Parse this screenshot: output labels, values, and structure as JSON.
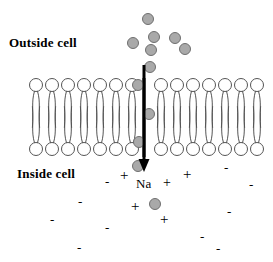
{
  "diagram": {
    "labels": {
      "outside": "Outside cell",
      "inside": "Inside cell",
      "ion_species": "Na"
    },
    "colors": {
      "ion_fill": "#a9a9a9",
      "ion_stroke": "#6f6f6f",
      "lipid_stroke": "#555555",
      "channel": "#000000",
      "arrow": "#000000",
      "text": "#000000",
      "background": "#ffffff"
    },
    "membrane": {
      "left_edge": 28,
      "right_edge": 253,
      "upper_leaflet_head_y": 85,
      "lower_leaflet_head_y": 149,
      "head_radius": 6.5,
      "lipid_spacing": 16,
      "left_lipid_count": 7,
      "right_lipid_count": 7,
      "channel_x": 144,
      "channel_top": 78,
      "channel_bottom": 157,
      "channel_width": 3
    },
    "arrow": {
      "x": 144,
      "y_start": 65,
      "y_end": 172,
      "head_width": 11,
      "head_length": 13,
      "shaft_width": 3,
      "direction": "downward"
    },
    "extracellular_ions": [
      {
        "cx": 148,
        "cy": 19,
        "r": 6
      },
      {
        "cx": 154,
        "cy": 37,
        "r": 6
      },
      {
        "cx": 133,
        "cy": 43,
        "r": 6
      },
      {
        "cx": 175,
        "cy": 38,
        "r": 6
      },
      {
        "cx": 151,
        "cy": 50,
        "r": 6
      },
      {
        "cx": 185,
        "cy": 49,
        "r": 6
      },
      {
        "cx": 150,
        "cy": 67,
        "r": 6
      }
    ],
    "channel_ions": [
      {
        "cx": 138,
        "cy": 85,
        "r": 6
      },
      {
        "cx": 149,
        "cy": 114,
        "r": 6
      },
      {
        "cx": 139,
        "cy": 142,
        "r": 6
      }
    ],
    "intracellular_ions": [
      {
        "cx": 138,
        "cy": 166,
        "r": 6
      },
      {
        "cx": 155,
        "cy": 204,
        "r": 6
      }
    ],
    "charges": [
      {
        "sign": "+",
        "x": 120,
        "y": 168,
        "size": 15
      },
      {
        "sign": "-",
        "x": 105,
        "y": 175,
        "size": 13
      },
      {
        "sign": "+",
        "x": 163,
        "y": 176,
        "size": 14
      },
      {
        "sign": "+",
        "x": 183,
        "y": 167,
        "size": 15
      },
      {
        "sign": "-",
        "x": 224,
        "y": 161,
        "size": 13
      },
      {
        "sign": "-",
        "x": 249,
        "y": 178,
        "size": 13
      },
      {
        "sign": "-",
        "x": 78,
        "y": 195,
        "size": 13
      },
      {
        "sign": "+",
        "x": 131,
        "y": 199,
        "size": 15
      },
      {
        "sign": "+",
        "x": 160,
        "y": 212,
        "size": 15
      },
      {
        "sign": "-",
        "x": 227,
        "y": 205,
        "size": 13
      },
      {
        "sign": "-",
        "x": 50,
        "y": 213,
        "size": 13
      },
      {
        "sign": "-",
        "x": 105,
        "y": 221,
        "size": 13
      },
      {
        "sign": "-",
        "x": 200,
        "y": 230,
        "size": 13
      },
      {
        "sign": "-",
        "x": 77,
        "y": 241,
        "size": 13
      },
      {
        "sign": "-",
        "x": 216,
        "y": 242,
        "size": 13
      }
    ]
  }
}
